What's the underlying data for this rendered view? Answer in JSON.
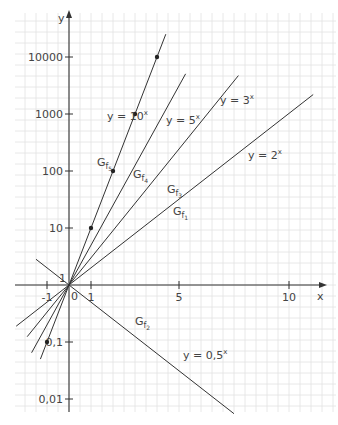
{
  "chart_data": {
    "type": "line",
    "title": "",
    "xlabel": "x",
    "ylabel": "y",
    "y_scale": "log",
    "xlim": [
      -2.4,
      11.9
    ],
    "ylim": [
      0.01,
      50000
    ],
    "grid": true,
    "x_ticks": [
      {
        "v": -1,
        "label": "-1"
      },
      {
        "v": 0,
        "label": "0"
      },
      {
        "v": 1,
        "label": "1"
      },
      {
        "v": 5,
        "label": "5"
      },
      {
        "v": 10,
        "label": "10"
      }
    ],
    "y_ticks": [
      {
        "v": 10000,
        "label": "10000"
      },
      {
        "v": 1000,
        "label": "1000"
      },
      {
        "v": 100,
        "label": "100"
      },
      {
        "v": 10,
        "label": "10"
      },
      {
        "v": 1,
        "label": "1"
      },
      {
        "v": 0.1,
        "label": "0,1"
      },
      {
        "v": 0.01,
        "label": "0,01"
      }
    ],
    "series": [
      {
        "name": "G_f1",
        "equation": "y = 2^x",
        "base": 2,
        "x_range": [
          -2.4,
          11.1
        ]
      },
      {
        "name": "G_f2",
        "equation": "y = 0,5^x",
        "base": 0.5,
        "x_range": [
          -1.5,
          7.5
        ]
      },
      {
        "name": "G_f3",
        "equation": "y = 3^x",
        "base": 3,
        "x_range": [
          -1.9,
          7.7
        ]
      },
      {
        "name": "G_f4",
        "equation": "y = 5^x",
        "base": 5,
        "x_range": [
          -1.7,
          5.3
        ]
      },
      {
        "name": "G_f5",
        "equation": "y = 10^x",
        "base": 10,
        "x_range": [
          -1.3,
          4.4
        ]
      }
    ],
    "marked_points": [
      {
        "x": -1,
        "y": 0.1
      },
      {
        "x": 1,
        "y": 10
      },
      {
        "x": 2,
        "y": 100
      },
      {
        "x": 3,
        "y": 1000
      },
      {
        "x": 4,
        "y": 10000
      }
    ],
    "annotations": [
      {
        "text": "y = 10",
        "sup": "x",
        "x": 107,
        "y": 120
      },
      {
        "text": "y = 5",
        "sup": "x",
        "x": 166,
        "y": 124
      },
      {
        "text": "y = 3",
        "sup": "x",
        "x": 220,
        "y": 104
      },
      {
        "text": "y = 2",
        "sup": "x",
        "x": 248,
        "y": 159
      },
      {
        "text": "y = 0,5",
        "sup": "x",
        "x": 183,
        "y": 359
      }
    ],
    "graph_labels": [
      {
        "text": "G",
        "sub": "f5",
        "x": 97,
        "y": 166
      },
      {
        "text": "G",
        "sub": "f4",
        "x": 133,
        "y": 178
      },
      {
        "text": "G",
        "sub": "f3",
        "x": 167,
        "y": 193
      },
      {
        "text": "G",
        "sub": "f1",
        "x": 173,
        "y": 215
      },
      {
        "text": "G",
        "sub": "f2",
        "x": 135,
        "y": 325
      }
    ]
  },
  "layout": {
    "origin_px": [
      69,
      285
    ],
    "px_per_x_unit": 22,
    "px_per_decade": 57,
    "grid_cell_px": 11,
    "frame": {
      "left": 15,
      "top": 13,
      "right": 336,
      "bottom": 412
    },
    "colors": {
      "axis": "#333333",
      "grid": "#e2e2e2",
      "curve": "#333333",
      "text": "#444444"
    }
  }
}
